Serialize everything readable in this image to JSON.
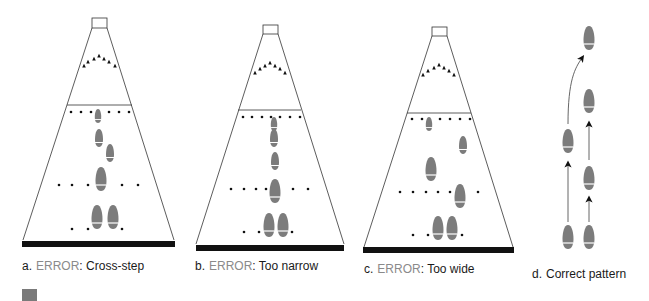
{
  "figure": {
    "colors": {
      "foot": "#7c7c7c",
      "line": "#333333",
      "bar": "#111111",
      "error_text": "#8a8a8a",
      "text": "#1a1a1a",
      "marker": "#7a7a7a"
    },
    "panels": [
      {
        "id": "a",
        "label": "a.",
        "error": "ERROR",
        "separator": ":",
        "description": "Cross-step"
      },
      {
        "id": "b",
        "label": "b.",
        "error": "ERROR",
        "separator": ":",
        "description": "Too narrow"
      },
      {
        "id": "c",
        "label": "c.",
        "error": "ERROR",
        "separator": ":",
        "description": "Too wide"
      },
      {
        "id": "d",
        "label": "d.",
        "error": "",
        "separator": "",
        "description": "Correct pattern"
      }
    ]
  }
}
